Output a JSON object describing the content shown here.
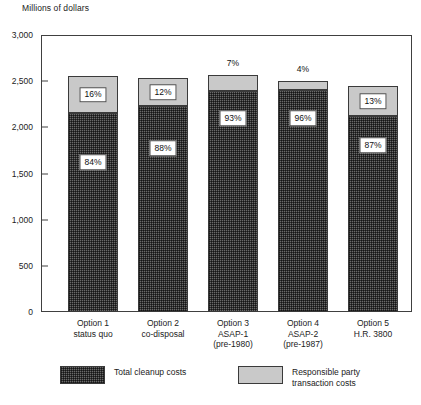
{
  "chart_data": {
    "type": "bar",
    "subtype": "stacked-percentage",
    "title": "",
    "ylabel": "Millions of dollars",
    "xlabel": "",
    "ylim": [
      0,
      3000
    ],
    "ytick_values": [
      3000,
      2500,
      2000,
      1500,
      1000,
      500,
      0
    ],
    "ytick_labels": [
      "3,000",
      "2,500",
      "2,000",
      "1,500",
      "1,000",
      "500",
      "0"
    ],
    "grid": false,
    "legend_position": "bottom",
    "categories": [
      "Option 1\nstatus quo",
      "Option 2\nco-disposal",
      "Option 3\nASAP-1\n(pre-1980)",
      "Option 4\nASAP-2\n(pre-1987)",
      "Option 5\nH.R. 3800"
    ],
    "category_lines": [
      [
        "Option 1",
        "status quo"
      ],
      [
        "Option 2",
        "co-disposal"
      ],
      [
        "Option 3",
        "ASAP-1",
        "(pre-1980)"
      ],
      [
        "Option 4",
        "ASAP-2",
        "(pre-1987)"
      ],
      [
        "Option 5",
        "H.R. 3800"
      ]
    ],
    "series": [
      {
        "name": "Total cleanup costs",
        "color": "#6a6a6a",
        "values": [
          2150,
          2230,
          2390,
          2400,
          2125
        ],
        "pct_labels": [
          "84%",
          "88%",
          "93%",
          "96%",
          "87%"
        ]
      },
      {
        "name": "Responsible party transaction costs",
        "color": "#c9c9c9",
        "values": [
          410,
          305,
          180,
          100,
          318
        ],
        "pct_labels": [
          "16%",
          "12%",
          "7%",
          "4%",
          "13%"
        ]
      }
    ],
    "totals": [
      2560,
      2535,
      2570,
      2500,
      2443
    ],
    "annotations": []
  },
  "legend": {
    "items": [
      {
        "label": "Total cleanup costs",
        "swatch": "dark-hatch"
      },
      {
        "label": "Responsible party\ntransaction costs",
        "swatch": "light-grey"
      }
    ]
  }
}
